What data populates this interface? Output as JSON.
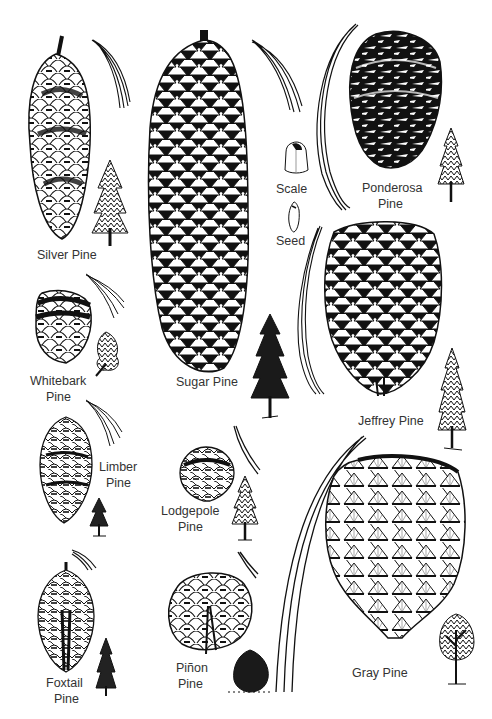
{
  "illustration": {
    "subject": "Pine cones of California",
    "background": "#ffffff",
    "ink": "#111111",
    "labels": {
      "silver": "Silver Pine",
      "whitebark_1": "Whitebark",
      "whitebark_2": "Pine",
      "limber_1": "Limber",
      "limber_2": "Pine",
      "foxtail_1": "Foxtail",
      "foxtail_2": "Pine",
      "sugar": "Sugar Pine",
      "lodgepole_1": "Lodgepole",
      "lodgepole_2": "Pine",
      "pinon_1": "Piñon",
      "pinon_2": "Pine",
      "scale": "Scale",
      "seed": "Seed",
      "ponderosa_1": "Ponderosa",
      "ponderosa_2": "Pine",
      "jeffrey": "Jeffrey Pine",
      "gray": "Gray Pine"
    }
  }
}
